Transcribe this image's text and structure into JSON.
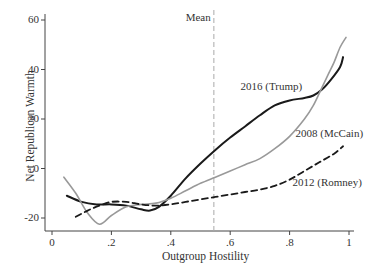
{
  "chart_data": {
    "type": "line",
    "title": "",
    "xlabel": "Outgroup Hostility",
    "ylabel": "Net Republican Warmth",
    "xlim": [
      0,
      1
    ],
    "ylim": [
      -25,
      62
    ],
    "x_ticks": [
      {
        "v": 0,
        "label": "0"
      },
      {
        "v": 0.2,
        "label": ".2"
      },
      {
        "v": 0.4,
        "label": ".4"
      },
      {
        "v": 0.6,
        "label": ".6"
      },
      {
        "v": 0.8,
        "label": ".8"
      },
      {
        "v": 1,
        "label": "1"
      }
    ],
    "y_ticks": [
      {
        "v": -20,
        "label": "-20"
      },
      {
        "v": 0,
        "label": "0"
      },
      {
        "v": 20,
        "label": "20"
      },
      {
        "v": 40,
        "label": "40"
      },
      {
        "v": 60,
        "label": "60"
      }
    ],
    "grid": false,
    "legend": "none (inline labels)",
    "reference_line": {
      "x": 0.545,
      "label": "Mean",
      "style": "dashed",
      "color": "#aaaaaa"
    },
    "series": [
      {
        "name": "2016 (Trump)",
        "color": "#1a1a1a",
        "style": "solid",
        "width": 2,
        "points": [
          [
            0.05,
            -11
          ],
          [
            0.1,
            -13.5
          ],
          [
            0.15,
            -14.5
          ],
          [
            0.2,
            -14.5
          ],
          [
            0.25,
            -15
          ],
          [
            0.3,
            -16.5
          ],
          [
            0.33,
            -17
          ],
          [
            0.36,
            -15.5
          ],
          [
            0.4,
            -11
          ],
          [
            0.45,
            -4
          ],
          [
            0.5,
            2
          ],
          [
            0.55,
            7.5
          ],
          [
            0.6,
            12.5
          ],
          [
            0.65,
            17
          ],
          [
            0.7,
            21.5
          ],
          [
            0.75,
            25.5
          ],
          [
            0.8,
            27.5
          ],
          [
            0.85,
            28.5
          ],
          [
            0.88,
            29.5
          ],
          [
            0.91,
            32
          ],
          [
            0.94,
            36
          ],
          [
            0.97,
            41
          ],
          [
            0.98,
            45
          ]
        ]
      },
      {
        "name": "2008 (McCain)",
        "color": "#999999",
        "style": "solid",
        "width": 1.6,
        "points": [
          [
            0.04,
            -3.5
          ],
          [
            0.08,
            -10
          ],
          [
            0.12,
            -18
          ],
          [
            0.16,
            -22.5
          ],
          [
            0.2,
            -19
          ],
          [
            0.25,
            -15.5
          ],
          [
            0.3,
            -14.5
          ],
          [
            0.35,
            -14
          ],
          [
            0.4,
            -12
          ],
          [
            0.45,
            -9
          ],
          [
            0.5,
            -6
          ],
          [
            0.55,
            -3.5
          ],
          [
            0.6,
            -1
          ],
          [
            0.65,
            1.5
          ],
          [
            0.7,
            4
          ],
          [
            0.75,
            8
          ],
          [
            0.8,
            13
          ],
          [
            0.85,
            20
          ],
          [
            0.88,
            25.5
          ],
          [
            0.91,
            33
          ],
          [
            0.93,
            38
          ],
          [
            0.95,
            43
          ],
          [
            0.97,
            49
          ],
          [
            0.99,
            53
          ]
        ]
      },
      {
        "name": "2012 (Romney)",
        "color": "#1a1a1a",
        "style": "dashed",
        "width": 1.8,
        "points": [
          [
            0.08,
            -19.5
          ],
          [
            0.12,
            -17
          ],
          [
            0.16,
            -15
          ],
          [
            0.2,
            -13.5
          ],
          [
            0.25,
            -13.5
          ],
          [
            0.3,
            -14.5
          ],
          [
            0.35,
            -15
          ],
          [
            0.4,
            -14.5
          ],
          [
            0.45,
            -13.5
          ],
          [
            0.5,
            -12.5
          ],
          [
            0.55,
            -11.5
          ],
          [
            0.6,
            -10.5
          ],
          [
            0.65,
            -9.5
          ],
          [
            0.7,
            -8.5
          ],
          [
            0.75,
            -7
          ],
          [
            0.8,
            -4.5
          ],
          [
            0.85,
            -1
          ],
          [
            0.9,
            2.5
          ],
          [
            0.95,
            6
          ],
          [
            0.98,
            9
          ]
        ]
      }
    ],
    "annotations": [
      {
        "text": "Mean",
        "x": 0.45,
        "y": 61
      },
      {
        "text": "2016 (Trump)",
        "x": 0.635,
        "y": 33
      },
      {
        "text": "2008 (McCain)",
        "x": 0.82,
        "y": 14
      },
      {
        "text": "2012 (Romney)",
        "x": 0.81,
        "y": -6
      }
    ]
  },
  "layout": {
    "plot": {
      "x0px": 52,
      "x1px": 349,
      "y_zero_px": 168.5,
      "px_per_y": 2.475,
      "axis_left_px": 45,
      "axis_bottom_px": 231,
      "axis_top_px": 14,
      "axis_right_px": 354
    }
  }
}
